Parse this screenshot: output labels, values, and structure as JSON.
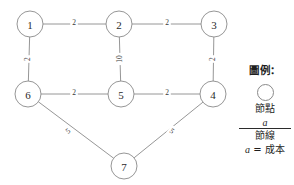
{
  "chart_data": {
    "type": "diagram",
    "title": "",
    "diagram_kind": "undirected-weighted-network-graph",
    "nodes": [
      {
        "id": "1",
        "label": "1",
        "x": 30,
        "y": 24
      },
      {
        "id": "2",
        "label": "2",
        "x": 119,
        "y": 24
      },
      {
        "id": "3",
        "label": "3",
        "x": 214,
        "y": 24
      },
      {
        "id": "6",
        "label": "6",
        "x": 28,
        "y": 94
      },
      {
        "id": "5",
        "label": "5",
        "x": 121,
        "y": 94
      },
      {
        "id": "4",
        "label": "4",
        "x": 213,
        "y": 94
      },
      {
        "id": "7",
        "label": "7",
        "x": 124,
        "y": 166
      }
    ],
    "node_radius": 13,
    "edges": [
      {
        "from": "1",
        "to": "2",
        "weight": "2",
        "label_x": 74,
        "label_y": 22,
        "rotate": 0
      },
      {
        "from": "2",
        "to": "3",
        "weight": "2",
        "label_x": 167,
        "label_y": 22,
        "rotate": 0
      },
      {
        "from": "1",
        "to": "6",
        "weight": "2",
        "label_x": 27,
        "label_y": 59,
        "rotate": -90
      },
      {
        "from": "2",
        "to": "5",
        "weight": "10",
        "label_x": 119,
        "label_y": 59,
        "rotate": -90
      },
      {
        "from": "3",
        "to": "4",
        "weight": "2",
        "label_x": 212,
        "label_y": 59,
        "rotate": -90
      },
      {
        "from": "6",
        "to": "5",
        "weight": "2",
        "label_x": 74,
        "label_y": 92,
        "rotate": 0
      },
      {
        "from": "5",
        "to": "4",
        "weight": "2",
        "label_x": 167,
        "label_y": 92,
        "rotate": 0
      },
      {
        "from": "6",
        "to": "7",
        "weight": "5",
        "label_x": 68,
        "label_y": 131,
        "rotate": -38
      },
      {
        "from": "4",
        "to": "7",
        "weight": "5",
        "label_x": 172,
        "label_y": 131,
        "rotate": 38
      }
    ],
    "xlabel": "",
    "ylabel": "",
    "grid": false,
    "legend_position": "right"
  },
  "legend": {
    "title": "圖例：",
    "node_symbol_caption": "節點",
    "edge_symbol_glyph": "a",
    "edge_symbol_caption": "節線",
    "cost_note_variable": "a",
    "cost_note_equals": "=",
    "cost_note_value": "成本"
  },
  "colors": {
    "stroke": "#8a8a8a",
    "text": "#2b2b2b",
    "background": "#ffffff",
    "legend_rule": "#2b2b2b"
  }
}
